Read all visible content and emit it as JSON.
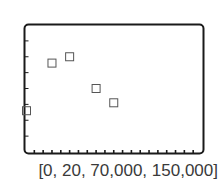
{
  "chart_data": {
    "type": "scatter",
    "title": "",
    "xlabel": "",
    "ylabel": "",
    "window_caption": "[0, 20, 70,000, 150,000]",
    "xlim": [
      0,
      20
    ],
    "ylim": [
      70000,
      150000
    ],
    "x_tick_step": 1,
    "y_tick_step": 10000,
    "grid": false,
    "legend": null,
    "marker": "open-square",
    "points": [
      {
        "x": 0,
        "y": 96000
      },
      {
        "x": 3,
        "y": 126000
      },
      {
        "x": 5,
        "y": 130000
      },
      {
        "x": 8,
        "y": 110000
      },
      {
        "x": 10,
        "y": 101000
      }
    ]
  },
  "colors": {
    "frame": "#1a1a1a",
    "marker": "#555555",
    "caption": "#3a3a3a"
  }
}
